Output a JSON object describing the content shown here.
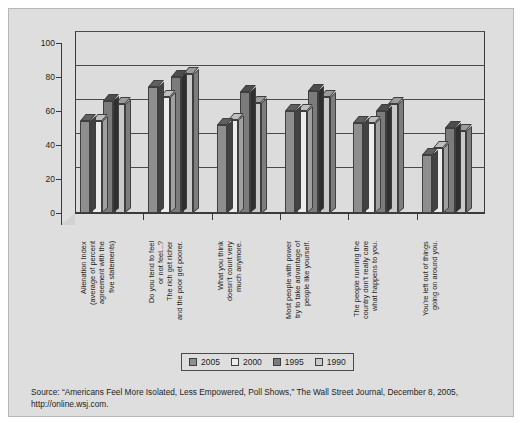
{
  "chart_data": {
    "type": "bar",
    "title": "",
    "subtitle": "",
    "xlabel": "",
    "ylabel": "",
    "ylim": [
      0,
      100
    ],
    "yticks": [
      0,
      20,
      40,
      60,
      80,
      100
    ],
    "grid": true,
    "legend_position": "bottom",
    "style": "3d-clustered-column",
    "categories": [
      "Alienation Index\n(average of percent\nagreement with the\nfive statements)",
      "Do you tend to feel\nor not feel...?\nThe rich get richer\nand the poor get poorer.",
      "What you think\ndoesn't count very\nmuch anymore.",
      "Most people with power\ntry to take advantage of\npeople like yourself.",
      "The people running the\ncountry don't really care\nwhat happens to you.",
      "You're left out of things\ngoing on around you."
    ],
    "series": [
      {
        "name": "2005",
        "color": "#8e8e8e",
        "values": [
          54,
          74,
          52,
          60,
          53,
          34
        ]
      },
      {
        "name": "2000",
        "color": "#ececec",
        "values": [
          54,
          68,
          55,
          60,
          53,
          38
        ]
      },
      {
        "name": "1995",
        "color": "#7b7b7b",
        "values": [
          66,
          80,
          71,
          72,
          60,
          50
        ]
      },
      {
        "name": "1990",
        "color": "#c9c9c9",
        "values": [
          64,
          82,
          65,
          68,
          64,
          48
        ]
      }
    ]
  },
  "legend": {
    "items": [
      {
        "label": "2005",
        "color": "#8e8e8e"
      },
      {
        "label": "2000",
        "color": "#ececec"
      },
      {
        "label": "1995",
        "color": "#7b7b7b"
      },
      {
        "label": "1990",
        "color": "#c9c9c9"
      }
    ]
  },
  "source": {
    "line1": "Source: “Americans Feel More Isolated, Less Empowered, Poll Shows,” The Wall Street Journal, December 8, 2005,",
    "line2": "http://online.wsj.com."
  },
  "colors": {
    "figure_background": "#dedede",
    "plot_wall": "#dcdcdc",
    "axis": "#3a3a3a",
    "text": "#1d1d1d"
  }
}
